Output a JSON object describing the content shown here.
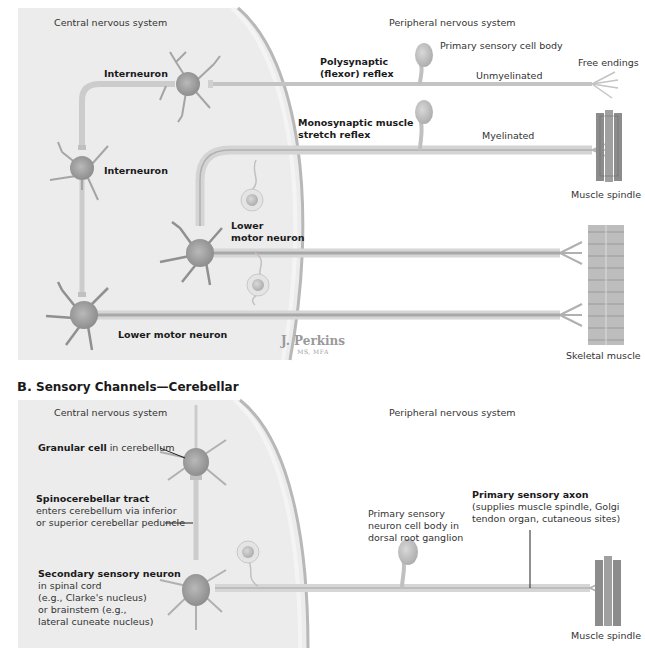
{
  "section_a": {
    "title_partial": "A. Sensory Channels—Reflex",
    "cns_label": "Central nervous system",
    "pns_label": "Peripheral nervous system",
    "labels": {
      "interneuron_top": "Interneuron",
      "interneuron_left": "Interneuron",
      "polysynaptic_1": "Polysynaptic",
      "polysynaptic_2": "(flexor) reflex",
      "primary_sensory_cell_body": "Primary sensory cell body",
      "unmyelinated": "Unmyelinated",
      "free_endings": "Free endings",
      "monosynaptic_1": "Monosynaptic muscle",
      "monosynaptic_2": "stretch reflex",
      "myelinated": "Myelinated",
      "muscle_spindle": "Muscle spindle",
      "lower_motor_neuron_1a": "Lower",
      "lower_motor_neuron_1b": "motor neuron",
      "lower_motor_neuron_2": "Lower motor neuron",
      "skeletal_muscle": "Skeletal muscle"
    },
    "signature": {
      "name": "J. Perkins",
      "credentials": "MS, MFA"
    }
  },
  "section_b": {
    "title_letter": "B.",
    "title_text": "Sensory Channels—Cerebellar",
    "cns_label": "Central nervous system",
    "pns_label": "Peripheral nervous system",
    "labels": {
      "granular_bold": "Granular cell",
      "granular_rest": " in cerebellum",
      "spino_bold": "Spinocerebellar tract",
      "spino_line1": "enters cerebellum via inferior",
      "spino_line2": "or superior cerebellar peduncle",
      "secondary_bold": "Secondary sensory neuron",
      "secondary_line1": "in spinal cord",
      "secondary_line2": "(e.g., Clarke's nucleus)",
      "secondary_line3": "or brainstem (e.g.,",
      "secondary_line4": "lateral cuneate nucleus)",
      "psn_line1": "Primary sensory",
      "psn_line2": "neuron cell body in",
      "psn_line3": "dorsal root ganglion",
      "axon_bold": "Primary sensory axon",
      "axon_line1": "(supplies muscle spindle, Golgi",
      "axon_line2": "tendon organ, cutaneous sites)",
      "muscle_spindle": "Muscle spindle"
    }
  },
  "colors": {
    "cns_bg": "#ececec",
    "neuron_body": "#9a9a9a",
    "axon": "#c8c8c8",
    "text": "#2a2a2a"
  }
}
